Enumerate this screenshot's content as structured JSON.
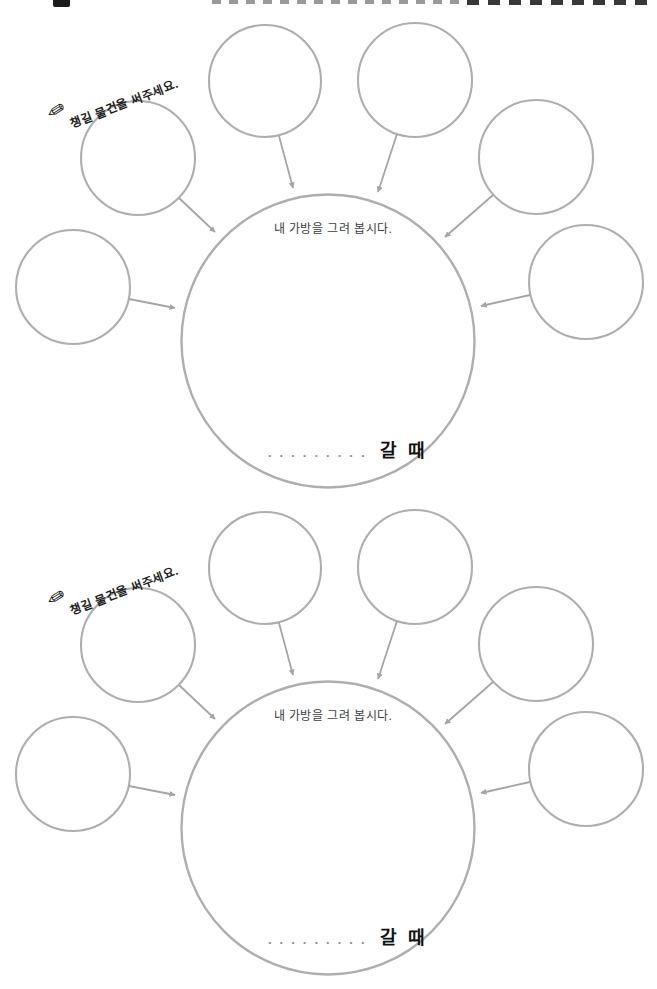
{
  "page": {
    "background": "#ffffff",
    "circle_stroke_color": "#aeaeae",
    "arrow_color": "#a5a5a5",
    "body_text_color": "#3d3d3d",
    "emphasis_text_color": "#101010"
  },
  "icons": {
    "pencil_glyph": "✎"
  },
  "sections": [
    {
      "prompt_label": "챙길 물건을 써주세요.",
      "center_label": "내 가방을 그려 봅시다.",
      "blank_dots": ".........",
      "when_label": "갈 때"
    },
    {
      "prompt_label": "챙길 물건을 써주세요.",
      "center_label": "내 가방을 그려 봅시다.",
      "blank_dots": ".........",
      "when_label": "갈 때"
    }
  ]
}
